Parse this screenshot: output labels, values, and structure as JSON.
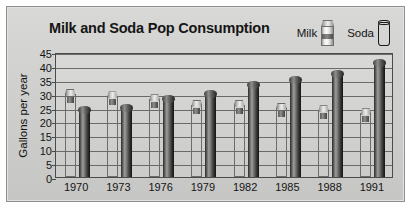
{
  "chart_data": {
    "type": "bar",
    "title": "Milk and Soda Pop Consumption",
    "xlabel": "",
    "ylabel": "Gallons per year",
    "categories": [
      "1970",
      "1973",
      "1976",
      "1979",
      "1982",
      "1985",
      "1988",
      "1991"
    ],
    "series": [
      {
        "name": "Milk",
        "values": [
          30,
          29,
          28,
          26,
          26,
          25,
          24,
          23
        ]
      },
      {
        "name": "Soda",
        "values": [
          24,
          25,
          28,
          30,
          33,
          35,
          37,
          41
        ]
      }
    ],
    "ylim": [
      0,
      45
    ],
    "ytick_labels": [
      "45",
      "40",
      "35",
      "30",
      "25",
      "20",
      "15",
      "10",
      "5",
      "0"
    ],
    "ytick_values": [
      45,
      40,
      35,
      30,
      25,
      20,
      15,
      10,
      5,
      0
    ],
    "grid": true,
    "legend_position": "top-right",
    "legend": [
      {
        "label": "Milk",
        "icon": "milk-carton-icon",
        "color": "#e4e4e2"
      },
      {
        "label": "Soda",
        "icon": "soda-can-icon",
        "color": "#2b2b29"
      }
    ]
  },
  "colors": {
    "frame_background": "#d2d2d0",
    "plot_background": "#d4d4d2",
    "gridline": "#6a6a68",
    "axis": "#4b4b49",
    "text": "#141414",
    "milk_bar": "#e4e4e2",
    "soda_bar": "#2b2b29"
  }
}
